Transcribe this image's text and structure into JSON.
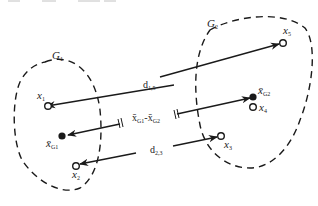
{
  "diagram": {
    "title": "",
    "groups": [
      {
        "id": "G1",
        "label": "G",
        "subscript": "1"
      },
      {
        "id": "G2",
        "label": "G",
        "subscript": "2"
      }
    ],
    "points": [
      {
        "id": "x1",
        "label": "x",
        "subscript": "1",
        "filled": false
      },
      {
        "id": "x2",
        "label": "x",
        "subscript": "2",
        "filled": false
      },
      {
        "id": "x3",
        "label": "x",
        "subscript": "3",
        "filled": false
      },
      {
        "id": "x4",
        "label": "x",
        "subscript": "4",
        "filled": false
      },
      {
        "id": "x5",
        "label": "x",
        "subscript": "5",
        "filled": false
      },
      {
        "id": "xG1",
        "label": "x̄",
        "subscript": "G1",
        "filled": true
      },
      {
        "id": "xG2",
        "label": "x̄",
        "subscript": "G2",
        "filled": true
      }
    ],
    "edges": [
      {
        "id": "d15",
        "label": "d",
        "subscript": "1,5",
        "from": "x1",
        "to": "x5"
      },
      {
        "id": "d23",
        "label": "d",
        "subscript": "2,3",
        "from": "x2",
        "to": "x3"
      },
      {
        "id": "centroid",
        "label_a": "x̄",
        "sub_a": "G1",
        "sep": "-",
        "label_b": "x̄",
        "sub_b": "G2",
        "from": "xG1",
        "to": "xG2"
      }
    ],
    "colors": {
      "stroke": "#1a1a1a",
      "background": "#ffffff"
    }
  }
}
